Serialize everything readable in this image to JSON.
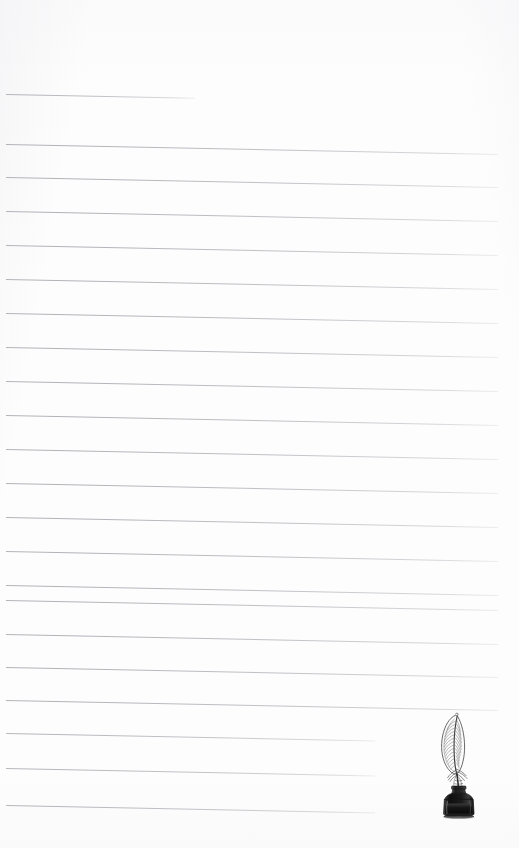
{
  "page": {
    "kind": "lined-notepaper",
    "width": 519,
    "height": 848,
    "background_color": "#fdfdfd",
    "rule_color": "#a8aab0",
    "title": "",
    "visible_text": ""
  },
  "rules": {
    "count": 22,
    "left_x": 6,
    "full_right_x": 498,
    "first_line_right_x": 195,
    "short_line_right_x": 375,
    "slope_px": 10,
    "items": [
      {
        "index": 0,
        "y": 94,
        "x1": 6,
        "x2": 195,
        "length": "short"
      },
      {
        "index": 1,
        "y": 144,
        "x1": 6,
        "x2": 498,
        "length": "full"
      },
      {
        "index": 2,
        "y": 177,
        "x1": 6,
        "x2": 498,
        "length": "full"
      },
      {
        "index": 3,
        "y": 211,
        "x1": 6,
        "x2": 498,
        "length": "full"
      },
      {
        "index": 4,
        "y": 245,
        "x1": 6,
        "x2": 498,
        "length": "full"
      },
      {
        "index": 5,
        "y": 279,
        "x1": 6,
        "x2": 498,
        "length": "full"
      },
      {
        "index": 6,
        "y": 313,
        "x1": 6,
        "x2": 498,
        "length": "full"
      },
      {
        "index": 7,
        "y": 347,
        "x1": 6,
        "x2": 498,
        "length": "full"
      },
      {
        "index": 8,
        "y": 381,
        "x1": 6,
        "x2": 498,
        "length": "full"
      },
      {
        "index": 9,
        "y": 415,
        "x1": 6,
        "x2": 498,
        "length": "full"
      },
      {
        "index": 10,
        "y": 449,
        "x1": 6,
        "x2": 498,
        "length": "full"
      },
      {
        "index": 11,
        "y": 483,
        "x1": 6,
        "x2": 498,
        "length": "full"
      },
      {
        "index": 12,
        "y": 517,
        "x1": 6,
        "x2": 498,
        "length": "full"
      },
      {
        "index": 13,
        "y": 551,
        "x1": 6,
        "x2": 498,
        "length": "full"
      },
      {
        "index": 14,
        "y": 585,
        "x1": 6,
        "x2": 498,
        "length": "full"
      },
      {
        "index": 15,
        "y": 600,
        "x1": 6,
        "x2": 498,
        "length": "full"
      },
      {
        "index": 16,
        "y": 634,
        "x1": 6,
        "x2": 498,
        "length": "full"
      },
      {
        "index": 17,
        "y": 667,
        "x1": 6,
        "x2": 498,
        "length": "full"
      },
      {
        "index": 18,
        "y": 700,
        "x1": 6,
        "x2": 498,
        "length": "full"
      },
      {
        "index": 19,
        "y": 733,
        "x1": 6,
        "x2": 375,
        "length": "short"
      },
      {
        "index": 20,
        "y": 768,
        "x1": 6,
        "x2": 375,
        "length": "short"
      },
      {
        "index": 21,
        "y": 805,
        "x1": 6,
        "x2": 375,
        "length": "short"
      }
    ]
  },
  "illustration": {
    "name": "quill-pen-in-inkwell",
    "description": "Vintage engraved feather quill standing in a dark glass ink bottle",
    "x": 424,
    "y": 710,
    "width": 70,
    "height": 110,
    "feather_color": "#6b6b6b",
    "ink_color": "#1a1a1a",
    "bottle_color": "#2b2b2b"
  }
}
